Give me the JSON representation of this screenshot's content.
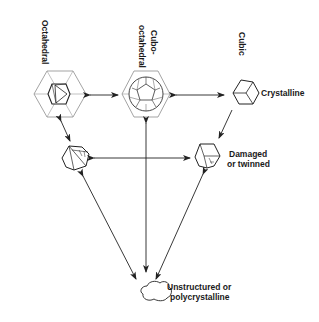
{
  "diagram": {
    "nodes": [
      {
        "id": "octahedral",
        "label": "Octahedral",
        "shape": "octahedron-in-hexagon-icon"
      },
      {
        "id": "cubo-octahedral",
        "label_line1": "Cubo-",
        "label_line2": "octahedral",
        "shape": "cuboctahedron-in-hexagon-icon"
      },
      {
        "id": "cubic",
        "label": "Cubic",
        "shape": "cube-icon"
      },
      {
        "id": "crystalline",
        "label": "Crystalline"
      },
      {
        "id": "twinned-left",
        "shape": "twinned-polyhedron-icon"
      },
      {
        "id": "damaged",
        "label_line1": "Damaged",
        "label_line2": "or twinned",
        "shape": "damaged-polyhedron-icon"
      },
      {
        "id": "unstructured",
        "label_line1": "Unstructured or",
        "label_line2": "polycrystalline",
        "shape": "blob-icon"
      }
    ],
    "edges": [
      {
        "from": "octahedral",
        "to": "cubo-octahedral",
        "type": "double-arrow"
      },
      {
        "from": "cubo-octahedral",
        "to": "cubic",
        "type": "double-arrow"
      },
      {
        "from": "octahedral",
        "to": "twinned-left",
        "type": "double-arrow"
      },
      {
        "from": "cubic",
        "to": "damaged",
        "type": "arrow"
      },
      {
        "from": "twinned-left",
        "to": "damaged",
        "type": "double-arrow"
      },
      {
        "from": "cubo-octahedral",
        "to": "unstructured",
        "type": "double-arrow"
      },
      {
        "from": "twinned-left",
        "to": "unstructured",
        "type": "double-arrow"
      },
      {
        "from": "damaged",
        "to": "unstructured",
        "type": "double-arrow"
      }
    ],
    "colors": {
      "line": "#222222",
      "hexagon": "#888888",
      "background": "#ffffff"
    }
  }
}
